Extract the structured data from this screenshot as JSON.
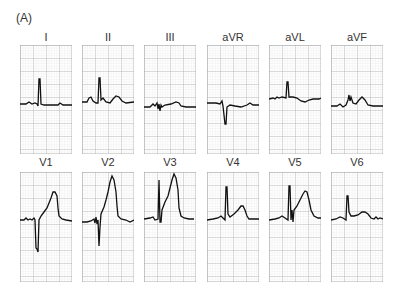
{
  "figure": {
    "label": "(A)",
    "grid": {
      "minor_color": "#d9d9d9",
      "major_color": "#a8a8a8",
      "trace_color": "#111111"
    },
    "rows": [
      {
        "leads": [
          {
            "name": "I"
          },
          {
            "name": "II"
          },
          {
            "name": "III"
          },
          {
            "name": "aVR"
          },
          {
            "name": "aVL"
          },
          {
            "name": "aVF"
          }
        ]
      },
      {
        "leads": [
          {
            "name": "V1"
          },
          {
            "name": "V2"
          },
          {
            "name": "V3"
          },
          {
            "name": "V4"
          },
          {
            "name": "V5"
          },
          {
            "name": "V6"
          }
        ]
      }
    ]
  }
}
